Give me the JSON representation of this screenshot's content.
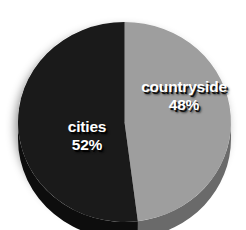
{
  "chart_data": {
    "type": "pie",
    "title": "",
    "subtitle": "",
    "xlabel": "",
    "ylabel": "",
    "legend_position": "none",
    "grid": false,
    "style": "3d-pie",
    "start_angle_deg": 0,
    "direction": "clockwise",
    "unit": "%",
    "categories": [
      "countryside",
      "cities"
    ],
    "values": [
      48,
      52
    ],
    "slices": [
      {
        "label": "countryside",
        "value": 48,
        "value_text": "48%",
        "color": "#9e9e9e",
        "side_color": "#6a6a6a",
        "label_color": "#ffffff"
      },
      {
        "label": "cities",
        "value": 52,
        "value_text": "52%",
        "color": "#1a1a1a",
        "side_color": "#0d0d0d",
        "label_color": "#ffffff"
      }
    ],
    "annotations": []
  },
  "colors": {
    "background": "#ffffff",
    "countryside": "#9e9e9e",
    "countryside_side": "#6a6a6a",
    "cities": "#1a1a1a",
    "cities_side": "#0d0d0d",
    "label_text": "#ffffff",
    "shadow": "#000000"
  },
  "labels": {
    "countryside": {
      "name": "countryside",
      "value": "48%"
    },
    "cities": {
      "name": "cities",
      "value": "52%"
    }
  }
}
